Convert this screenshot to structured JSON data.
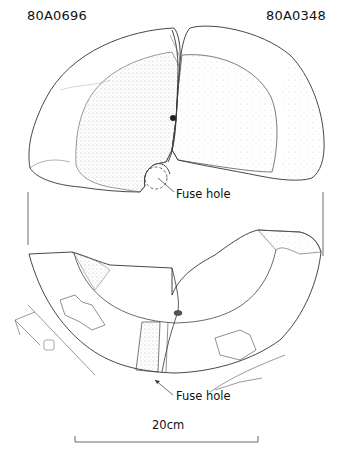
{
  "figure": {
    "labels": {
      "left_id": "80A0696",
      "right_id": "80A0348"
    },
    "annotations": [
      {
        "text": "Fuse hole",
        "target": "top-view fuse hole"
      },
      {
        "text": "Fuse hole",
        "target": "bottom-view fuse hole"
      }
    ],
    "scale_bar": {
      "label": "20cm"
    },
    "colors": {
      "line": "#333333",
      "stipple": "#8a8a8a",
      "text": "#111111",
      "background": "#ffffff"
    }
  }
}
